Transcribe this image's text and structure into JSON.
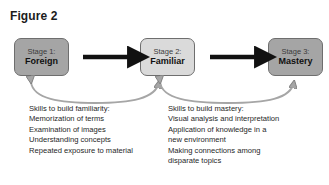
{
  "figure": {
    "title": "Figure 2",
    "type": "process-flow-diagram"
  },
  "colors": {
    "box_dark": "#a5a5a5",
    "box_light": "#dadada",
    "box_border": "#6e6e6e",
    "arrow_straight": "#111111",
    "arrow_curved": "#8c8c8c",
    "text": "#1f1f1f",
    "background": "#ffffff"
  },
  "stages": [
    {
      "id": "stage-1",
      "label_top": "Stage 1:",
      "label_bottom": "Foreign",
      "fill": "dark"
    },
    {
      "id": "stage-2",
      "label_top": "Stage 2:",
      "label_bottom": "Familiar",
      "fill": "light"
    },
    {
      "id": "stage-3",
      "label_top": "Stage 3:",
      "label_bottom": "Mastery",
      "fill": "dark"
    }
  ],
  "connectors": [
    {
      "id": "arrow-stage1-stage2",
      "style": "straight",
      "direction": "right",
      "from": "stage-1",
      "to": "stage-2"
    },
    {
      "id": "arrow-stage2-stage3",
      "style": "straight",
      "direction": "right",
      "from": "stage-2",
      "to": "stage-3"
    },
    {
      "id": "curve-familiarity",
      "style": "curved",
      "direction": "bidirectional",
      "from": "stage-1",
      "to": "stage-2"
    },
    {
      "id": "curve-mastery",
      "style": "curved",
      "direction": "bidirectional",
      "from": "stage-2",
      "to": "stage-3"
    }
  ],
  "skill_blocks": [
    {
      "id": "familiarity-skills",
      "heading": "Skills to build familiarity:",
      "lines": [
        "Memorization of terms",
        "Examination of images",
        "Understanding concepts",
        "Repeated exposure to material"
      ]
    },
    {
      "id": "mastery-skills",
      "heading": "Skills to build mastery:",
      "lines": [
        "Visual analysis and interpretation",
        "Application of knowledge in a",
        "new environment",
        "Making connections among",
        "disparate topics"
      ]
    }
  ]
}
